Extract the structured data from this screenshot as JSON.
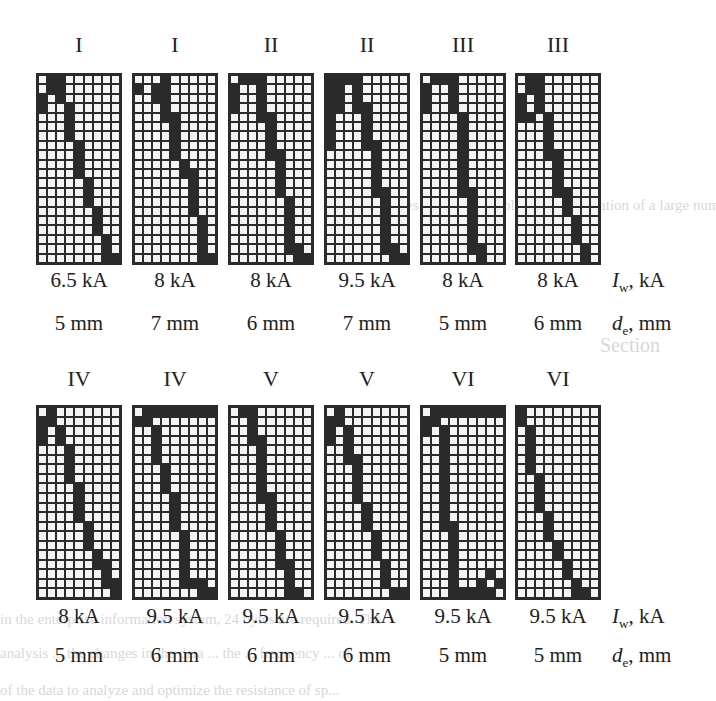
{
  "figure": {
    "grid_cols": 9,
    "grid_rows": 20,
    "axis_labels": {
      "current_symbol": "I",
      "current_sub": "w",
      "current_unit": ", kA",
      "diameter_symbol": "d",
      "diameter_sub": "e",
      "diameter_unit": ", mm"
    },
    "top_row": [
      {
        "class": "I",
        "current": "6.5 kA",
        "diameter": "5 mm",
        "cells": [
          [
            1,
            2
          ],
          [
            1,
            2
          ],
          [
            0,
            2
          ],
          [
            0,
            3
          ],
          [
            3
          ],
          [
            3
          ],
          [
            3
          ],
          [
            4
          ],
          [
            4
          ],
          [
            4
          ],
          [
            4
          ],
          [
            5
          ],
          [
            5
          ],
          [
            5
          ],
          [
            6
          ],
          [
            6
          ],
          [
            6
          ],
          [
            7
          ],
          [
            7
          ],
          [
            7,
            8
          ]
        ]
      },
      {
        "class": "I",
        "current": "8 kA",
        "diameter": "7 mm",
        "cells": [
          [
            3
          ],
          [
            0,
            2,
            3
          ],
          [
            2,
            3
          ],
          [
            3
          ],
          [
            3,
            4
          ],
          [
            4
          ],
          [
            4
          ],
          [
            4
          ],
          [
            4
          ],
          [
            5
          ],
          [
            5,
            6
          ],
          [
            6
          ],
          [
            6
          ],
          [
            6
          ],
          [
            6
          ],
          [
            7
          ],
          [
            7
          ],
          [
            7
          ],
          [
            7
          ],
          [
            7,
            8
          ]
        ]
      },
      {
        "class": "II",
        "current": "8 kA",
        "diameter": "6 mm",
        "cells": [
          [
            1,
            2,
            3
          ],
          [
            0,
            3
          ],
          [
            0,
            3
          ],
          [
            0,
            3
          ],
          [
            3,
            4
          ],
          [
            4
          ],
          [
            4
          ],
          [
            4
          ],
          [
            4,
            5
          ],
          [
            5
          ],
          [
            5
          ],
          [
            5
          ],
          [
            5
          ],
          [
            6
          ],
          [
            6
          ],
          [
            6
          ],
          [
            6
          ],
          [
            6
          ],
          [
            6,
            7
          ],
          [
            7,
            8
          ]
        ]
      },
      {
        "class": "II",
        "current": "9.5 kA",
        "diameter": "7 mm",
        "cells": [
          [
            0,
            1,
            2,
            3
          ],
          [
            0,
            1,
            3
          ],
          [
            0,
            1,
            3
          ],
          [
            0,
            1,
            3,
            4
          ],
          [
            0,
            4
          ],
          [
            0,
            4
          ],
          [
            0,
            4
          ],
          [
            0,
            4,
            5
          ],
          [
            5
          ],
          [
            5
          ],
          [
            5
          ],
          [
            5
          ],
          [
            5,
            6
          ],
          [
            6
          ],
          [
            6
          ],
          [
            6
          ],
          [
            6
          ],
          [
            6
          ],
          [
            6,
            7
          ],
          [
            7,
            8
          ]
        ]
      },
      {
        "class": "III",
        "current": "8 kA",
        "diameter": "5 mm",
        "cells": [
          [
            1,
            2,
            3
          ],
          [
            0,
            3
          ],
          [
            0,
            3
          ],
          [
            0,
            3
          ],
          [
            4
          ],
          [
            4
          ],
          [
            4
          ],
          [
            4
          ],
          [
            4
          ],
          [
            4
          ],
          [
            4
          ],
          [
            4
          ],
          [
            4,
            5
          ],
          [
            5
          ],
          [
            5
          ],
          [
            5
          ],
          [
            5
          ],
          [
            5
          ],
          [
            5,
            6
          ],
          [
            6
          ]
        ]
      },
      {
        "class": "III",
        "current": "8 kA",
        "diameter": "6 mm",
        "cells": [
          [
            1,
            2
          ],
          [
            1,
            2
          ],
          [
            0,
            2
          ],
          [
            0,
            2
          ],
          [
            0,
            1,
            3
          ],
          [
            3
          ],
          [
            3
          ],
          [
            3
          ],
          [
            3,
            4
          ],
          [
            4
          ],
          [
            4
          ],
          [
            4
          ],
          [
            4,
            5
          ],
          [
            5
          ],
          [
            5
          ],
          [
            6
          ],
          [
            6
          ],
          [
            6
          ],
          [
            7
          ],
          [
            7
          ]
        ]
      }
    ],
    "bottom_row": [
      {
        "class": "IV",
        "current": "8 kA",
        "diameter": "5 mm",
        "cells": [
          [
            1
          ],
          [
            0,
            1
          ],
          [
            0,
            2
          ],
          [
            0,
            2
          ],
          [
            3
          ],
          [
            3
          ],
          [
            3
          ],
          [
            3
          ],
          [
            4
          ],
          [
            4
          ],
          [
            4
          ],
          [
            4
          ],
          [
            5
          ],
          [
            5
          ],
          [
            5
          ],
          [
            6
          ],
          [
            6,
            7
          ],
          [
            7
          ],
          [
            7,
            8
          ],
          [
            8
          ]
        ]
      },
      {
        "class": "IV",
        "current": "9.5 kA",
        "diameter": "6 mm",
        "cells": [
          [
            1,
            2,
            3,
            4,
            5,
            6,
            7,
            8
          ],
          [
            0,
            1
          ],
          [
            2
          ],
          [
            2
          ],
          [
            2
          ],
          [
            2
          ],
          [
            3
          ],
          [
            3
          ],
          [
            3
          ],
          [
            4
          ],
          [
            4
          ],
          [
            4
          ],
          [
            4
          ],
          [
            5
          ],
          [
            5
          ],
          [
            5
          ],
          [
            5
          ],
          [
            5
          ],
          [
            5,
            6,
            7
          ],
          [
            7,
            8
          ]
        ]
      },
      {
        "class": "V",
        "current": "9.5 kA",
        "diameter": "6 mm",
        "cells": [
          [
            1,
            2
          ],
          [
            2
          ],
          [
            2
          ],
          [
            2,
            3
          ],
          [
            3
          ],
          [
            3
          ],
          [
            3
          ],
          [
            3
          ],
          [
            3
          ],
          [
            3,
            4
          ],
          [
            4
          ],
          [
            4
          ],
          [
            4
          ],
          [
            5
          ],
          [
            5
          ],
          [
            5
          ],
          [
            5,
            6
          ],
          [
            6
          ],
          [
            6
          ],
          [
            6,
            7
          ]
        ]
      },
      {
        "class": "V",
        "current": "9.5 kA",
        "diameter": "6 mm",
        "cells": [
          [
            1
          ],
          [
            0,
            1
          ],
          [
            0,
            2
          ],
          [
            0,
            2
          ],
          [
            2
          ],
          [
            2,
            3
          ],
          [
            3
          ],
          [
            3
          ],
          [
            3
          ],
          [
            3
          ],
          [
            4
          ],
          [
            4
          ],
          [
            4
          ],
          [
            5
          ],
          [
            5
          ],
          [
            5
          ],
          [
            6
          ],
          [
            6
          ],
          [
            6
          ],
          [
            7,
            8
          ]
        ]
      },
      {
        "class": "VI",
        "current": "9.5 kA",
        "diameter": "5 mm",
        "cells": [
          [
            1,
            2,
            3,
            4,
            5,
            6,
            7,
            8
          ],
          [
            0,
            1
          ],
          [
            0,
            2
          ],
          [
            2
          ],
          [
            2
          ],
          [
            2
          ],
          [
            2
          ],
          [
            2
          ],
          [
            2
          ],
          [
            2
          ],
          [
            2
          ],
          [
            2
          ],
          [
            2,
            3
          ],
          [
            3
          ],
          [
            3
          ],
          [
            3
          ],
          [
            3
          ],
          [
            3,
            7
          ],
          [
            3,
            6,
            8
          ],
          [
            3,
            4,
            5,
            6,
            7
          ]
        ]
      },
      {
        "class": "VI",
        "current": "9.5 kA",
        "diameter": "5 mm",
        "cells": [
          [
            0
          ],
          [
            0
          ],
          [
            1
          ],
          [
            1
          ],
          [
            1
          ],
          [
            1
          ],
          [
            1
          ],
          [
            2
          ],
          [
            2
          ],
          [
            2
          ],
          [
            2
          ],
          [
            3
          ],
          [
            3
          ],
          [
            3
          ],
          [
            4
          ],
          [
            4
          ],
          [
            5
          ],
          [
            5
          ],
          [
            6
          ],
          [
            6,
            7
          ]
        ]
      }
    ]
  },
  "background_text": [
    "ssages of tuning...          ...ble for the regulation of a large number",
    "Section",
    "the mass of ... the welding current ... the system of",
    "cess is based ... on the ... electrode",
    "connection ... parameters ... welding",
    "An algorithm ... for ... the quality ...",
    "Step for large ... and ... parameters ... the",
    "as processes ... ... ...",
    "ing data ... the data ... ... ... ... systems",
    "in the enterprise information system, 24 bytes are required. The",
    "analysis ... the changes in the data ... the ... frequency ... of",
    "of the data to analyze and optimize the resistance of sp..."
  ]
}
